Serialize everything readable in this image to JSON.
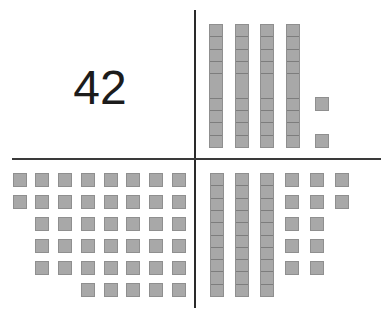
{
  "diagram": {
    "number_label": "42",
    "colors": {
      "block_fill": "#a8a8a8",
      "block_border": "#8f8f8f",
      "line": "#2a2a2a",
      "text": "#1c1c1c"
    },
    "quadrants": {
      "top_left": {
        "type": "numeral",
        "value": "42"
      },
      "top_right": {
        "type": "tens_and_ones",
        "tens_rods": 4,
        "ones_units": 2,
        "total": 42
      },
      "bottom_left": {
        "type": "ones_only",
        "rows": [
          8,
          8,
          7,
          7,
          7,
          5
        ],
        "total": 42
      },
      "bottom_right": {
        "type": "tens_and_ones",
        "tens_rods": 3,
        "ones_units": 12,
        "ones_rows": [
          3,
          3,
          2,
          2,
          2
        ],
        "total": 42
      }
    }
  }
}
